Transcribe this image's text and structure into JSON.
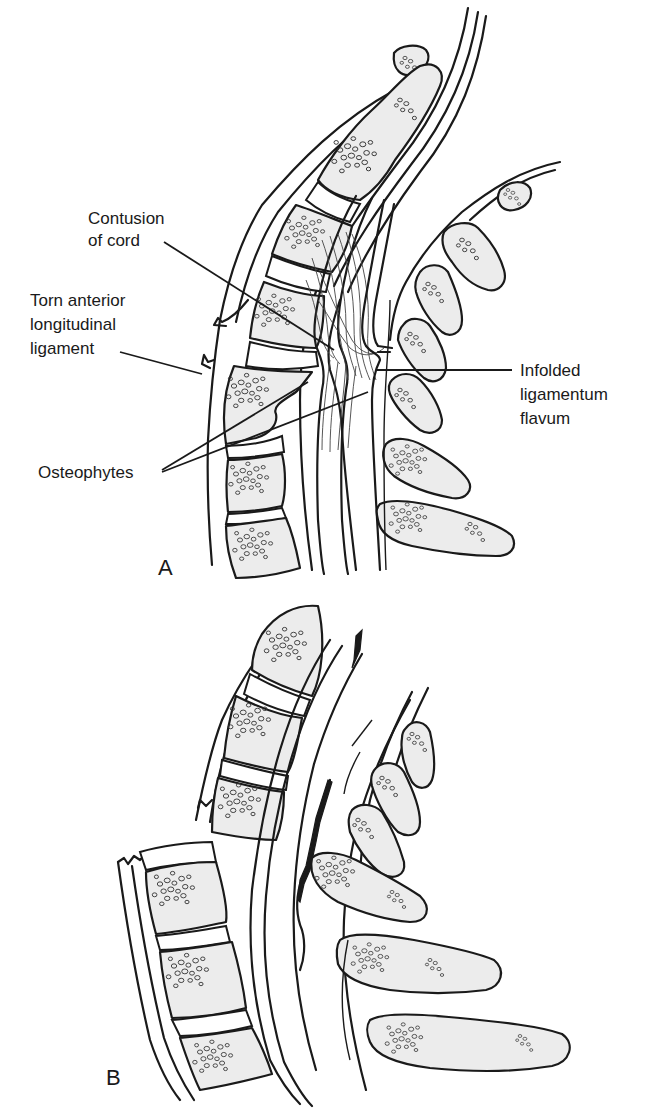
{
  "figure": {
    "panels": [
      {
        "id": "A",
        "label": "A",
        "description": "Sagittal view of cervical spine in hyperextension injury",
        "annotations": [
          {
            "id": "contusion",
            "lines": [
              "Contusion",
              "of cord"
            ]
          },
          {
            "id": "torn-all",
            "lines": [
              "Torn anterior",
              "longitudinal",
              "ligament"
            ]
          },
          {
            "id": "infolded",
            "lines": [
              "Infolded",
              "ligamentum",
              "flavum"
            ]
          },
          {
            "id": "osteophytes",
            "lines": [
              "Osteophytes"
            ]
          }
        ]
      },
      {
        "id": "B",
        "label": "B",
        "description": "Sagittal view of cervical spine showing cord damage after injury",
        "annotations": []
      }
    ],
    "colors": {
      "line": "#1a1a1a",
      "bone_fill": "#ececec",
      "background": "#ffffff"
    }
  }
}
